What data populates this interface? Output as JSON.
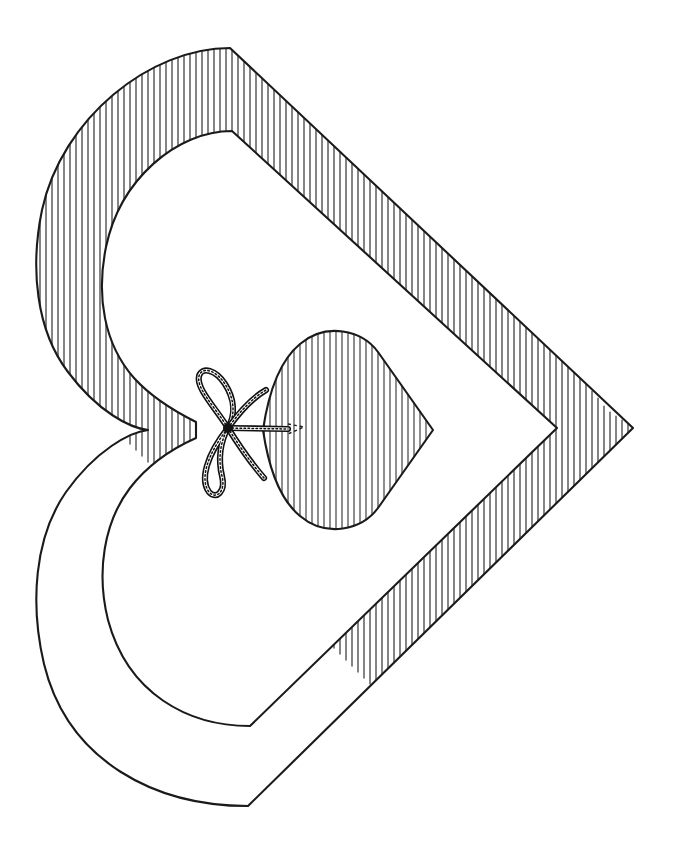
{
  "artwork": {
    "title": "Hatched Heart Outline with Corded Bow and Inner Heart",
    "caption": "",
    "medium": "pen-and-ink line drawing",
    "orientation": "heart rotated 90 degrees clockwise, point facing right",
    "background_color": "#ffffff",
    "ink_color": "#1a1a1a",
    "hatch_color": "#3a3a3a",
    "canvas": {
      "width": 680,
      "height": 854
    },
    "elements": [
      {
        "name": "outer-heart-band",
        "description": "Large open heart outline drawn as a thick band filled with vertical hatching",
        "hatch_style": "vertical short strokes",
        "hatch_spacing_px": 6
      },
      {
        "name": "inner-heart-opening",
        "description": "Blank unhatched heart-shaped void inside the band"
      },
      {
        "name": "small-heart",
        "description": "Small solid heart fully filled with vertical hatching, point facing right",
        "hatch_style": "vertical short strokes",
        "hatch_spacing_px": 6
      },
      {
        "name": "cord-bow",
        "description": "Twisted rope tied into a two-loop bow with two trailing tails, attached at the notch of the small heart",
        "loops": 2,
        "tails": 2
      },
      {
        "name": "cord-stem",
        "description": "Short twisted rope segment running from the bow knot into the notch of the small heart"
      }
    ],
    "geometry": {
      "outer_heart": {
        "top_lobe_peak": [
          230,
          48
        ],
        "left_extent": [
          34,
          300
        ],
        "right_point": [
          633,
          428
        ],
        "bottom_extent": [
          250,
          806
        ],
        "center_notch": [
          148,
          430
        ]
      },
      "small_heart": {
        "left_notch": [
          263,
          430
        ],
        "right_point": [
          433,
          430
        ],
        "top": [
          315,
          334
        ],
        "bottom": [
          322,
          527
        ]
      },
      "bow_knot": [
        228,
        428
      ]
    },
    "palette": {
      "paper": "#ffffff",
      "outline": "#1a1a1a",
      "hatching": "#3a3a3a",
      "rope": "#111111"
    }
  }
}
